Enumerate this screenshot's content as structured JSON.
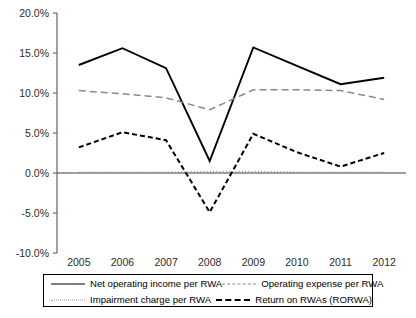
{
  "chart_data": {
    "type": "line",
    "title": "",
    "xlabel": "",
    "ylabel": "",
    "grid": false,
    "legend_position": "bottom",
    "ylim": [
      -10.0,
      20.0
    ],
    "ytick_labels": [
      "20.0%",
      "15.0%",
      "10.0%",
      "5.0%",
      "0.0%",
      "-5.0%",
      "-10.0%"
    ],
    "ytick_values": [
      20.0,
      15.0,
      10.0,
      5.0,
      0.0,
      -5.0,
      -10.0
    ],
    "categories": [
      "2005",
      "2006",
      "2007",
      "2008",
      "2009",
      "2010",
      "2011",
      "2012"
    ],
    "x": [
      2005,
      2006,
      2007,
      2008,
      2009,
      2010,
      2011,
      2012
    ],
    "series": [
      {
        "name": "Net operating income per RWA",
        "style": "solid",
        "color": "#000000",
        "values": [
          13.5,
          15.6,
          13.1,
          1.5,
          15.7,
          13.4,
          11.1,
          11.9
        ]
      },
      {
        "name": "Operating expense per RWA",
        "style": "dashed",
        "color": "#8a8a8a",
        "values": [
          10.3,
          9.9,
          9.4,
          7.9,
          10.4,
          10.4,
          10.3,
          9.2
        ]
      },
      {
        "name": "Impairment charge per RWA",
        "style": "dotted",
        "color": "#9a9a9a",
        "values": [
          0.1,
          0.1,
          0.1,
          0.2,
          0.2,
          0.1,
          0.1,
          0.1
        ]
      },
      {
        "name": "Return on RWAs (RORWA)",
        "style": "dashed",
        "color": "#000000",
        "values": [
          3.2,
          5.1,
          4.1,
          -4.9,
          4.9,
          2.6,
          0.8,
          2.5
        ]
      }
    ]
  },
  "legend": {
    "entries": [
      {
        "label": "Net operating income per RWA",
        "swatch": "solid-line-swatch"
      },
      {
        "label": "Operating expense per RWA",
        "swatch": "gray-dashed-line-swatch"
      },
      {
        "label": "Impairment charge per RWA",
        "swatch": "dotted-line-swatch"
      },
      {
        "label": "Return on RWAs (RORWA)",
        "swatch": "black-dashed-line-swatch"
      }
    ]
  },
  "colors": {
    "axis": "#6f6f6f",
    "text": "#000000",
    "net_operating_income": "#000000",
    "operating_expense": "#8a8a8a",
    "impairment_charge": "#9a9a9a",
    "rorwa": "#000000"
  }
}
